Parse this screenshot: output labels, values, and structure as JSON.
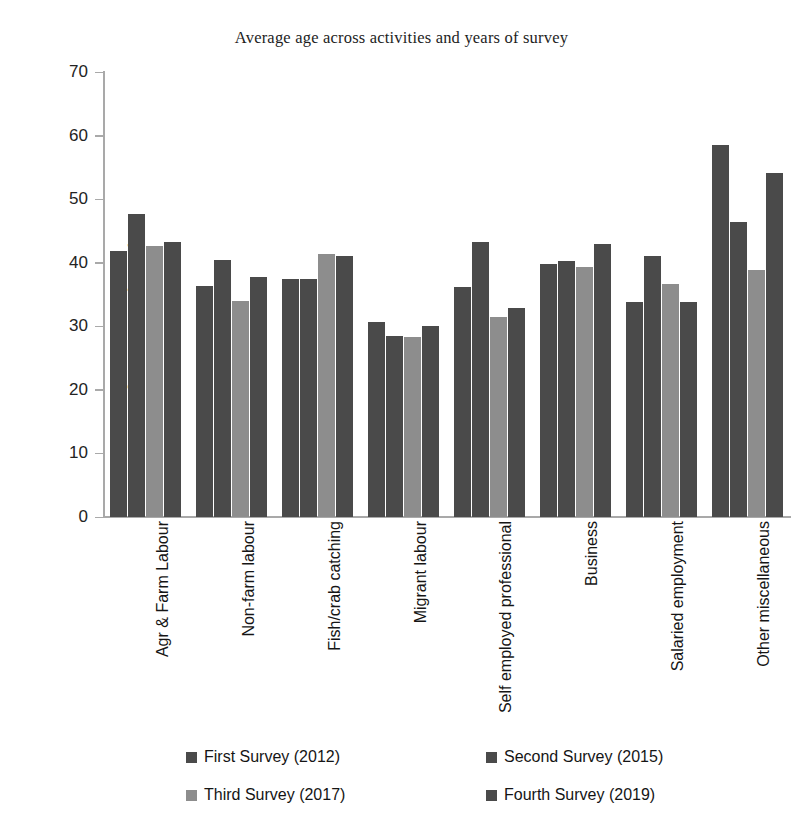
{
  "chart_data": {
    "type": "bar",
    "title": "Average age across activities and years of survey",
    "xlabel": "",
    "ylabel": "Average age (years)",
    "ylim": [
      0,
      70
    ],
    "yticks": [
      70,
      60,
      50,
      40,
      30,
      20,
      10,
      0
    ],
    "grid": false,
    "legend_position": "bottom",
    "categories": [
      "Agr & Farm Labour",
      "Non-farm labour",
      "Fish/crab catching",
      "Migrant labour",
      "Self employed professional",
      "Business",
      "Salaried employment",
      "Other miscellaneous"
    ],
    "series": [
      {
        "name": "First Survey (2012)",
        "color": "#4a4a4a",
        "values": [
          41.8,
          36.3,
          37.4,
          30.7,
          36.2,
          39.8,
          33.9,
          58.5
        ]
      },
      {
        "name": "Second Survey (2015)",
        "color": "#4a4a4a",
        "values": [
          47.6,
          40.5,
          37.4,
          28.5,
          43.3,
          40.3,
          41.1,
          46.4
        ]
      },
      {
        "name": "Third Survey (2017)",
        "color": "#8d8d8d",
        "values": [
          42.7,
          34.0,
          41.3,
          28.3,
          31.4,
          39.4,
          36.7,
          38.9
        ]
      },
      {
        "name": "Fourth Survey (2019)",
        "color": "#4a4a4a",
        "values": [
          43.2,
          37.7,
          41.0,
          30.0,
          32.9,
          42.9,
          33.9,
          54.1
        ]
      }
    ]
  }
}
